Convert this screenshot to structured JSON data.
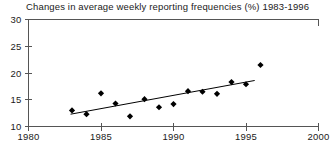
{
  "chart_data": {
    "type": "scatter",
    "title": "Changes in average weekly reporting frequencies (%) 1983-1996",
    "xlabel": "",
    "ylabel": "",
    "xlim": [
      1980,
      2000
    ],
    "ylim": [
      10,
      30
    ],
    "xticks": [
      1980,
      1985,
      1990,
      1995,
      2000
    ],
    "xticklabels": [
      "1980",
      "1985",
      "1990",
      "1995",
      "2000"
    ],
    "yticks": [
      10,
      15,
      20,
      25,
      30
    ],
    "yticklabels": [
      "10",
      "15",
      "20",
      "25",
      "30"
    ],
    "grid": false,
    "legend": null,
    "series": [
      {
        "name": "average weekly reporting frequency",
        "marker": "diamond",
        "color": "#000000",
        "x": [
          1983,
          1984,
          1985,
          1986,
          1987,
          1988,
          1989,
          1990,
          1991,
          1992,
          1993,
          1994,
          1995,
          1996
        ],
        "values": [
          13.0,
          12.3,
          16.2,
          14.3,
          11.9,
          15.1,
          13.6,
          14.2,
          16.6,
          16.5,
          16.1,
          18.3,
          17.9,
          21.5
        ]
      },
      {
        "name": "linear trend line",
        "marker": "none",
        "color": "#000000",
        "x": [
          1982.9,
          1995.6
        ],
        "values": [
          12.3,
          18.6
        ]
      }
    ]
  }
}
